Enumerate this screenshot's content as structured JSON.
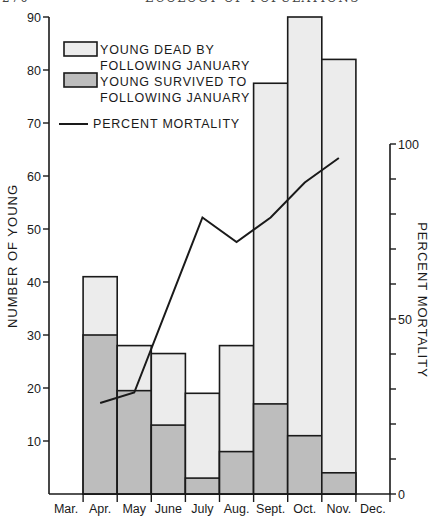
{
  "header": {
    "page_number": "270",
    "running_title": "ECOLOGY OF POPULATIONS"
  },
  "colors": {
    "dead_fill": "#ececec",
    "survived_fill": "#bdbdbd",
    "line": "#1a1a1a",
    "axis": "#1a1a1a"
  },
  "chart_data": {
    "type": "bar",
    "subtype": "stacked bar with line on secondary axis",
    "title": "",
    "xlabel": "",
    "ylabel": "NUMBER OF YOUNG",
    "y2label": "PERCENT MORTALITY",
    "categories": [
      "Mar.",
      "Apr.",
      "May",
      "June",
      "July",
      "Aug.",
      "Sept.",
      "Oct.",
      "Nov.",
      "Dec."
    ],
    "ylim": [
      0,
      90
    ],
    "yticks": [
      10,
      20,
      30,
      40,
      50,
      60,
      70,
      80,
      90
    ],
    "y2lim": [
      0,
      100
    ],
    "y2ticks_labeled": [
      0,
      50,
      100
    ],
    "y2ticks_minor_step": 10,
    "grid": false,
    "legend_position": "upper-left",
    "legend": [
      {
        "key": "dead",
        "label_lines": [
          "YOUNG DEAD BY",
          "FOLLOWING JANUARY"
        ],
        "style": "light-box"
      },
      {
        "key": "survived",
        "label_lines": [
          "YOUNG SURVIVED TO",
          "FOLLOWING JANUARY"
        ],
        "style": "dark-box"
      },
      {
        "key": "mortality",
        "label_lines": [
          "PERCENT MORTALITY"
        ],
        "style": "line"
      }
    ],
    "series": [
      {
        "name": "YOUNG SURVIVED TO FOLLOWING JANUARY",
        "axis": "left",
        "kind": "bar-bottom",
        "values": [
          0,
          30,
          19.5,
          13,
          3,
          8,
          17,
          11,
          4,
          0
        ]
      },
      {
        "name": "YOUNG DEAD BY FOLLOWING JANUARY",
        "axis": "left",
        "kind": "bar-top",
        "values": [
          0,
          11,
          8.5,
          13.5,
          16,
          20,
          60.5,
          79,
          78,
          0
        ]
      },
      {
        "name": "TOTAL YOUNG",
        "axis": "left",
        "kind": "bar-total",
        "values": [
          0,
          41,
          28,
          26.5,
          19,
          28,
          77.5,
          90,
          82,
          0
        ]
      },
      {
        "name": "PERCENT MORTALITY",
        "axis": "right",
        "kind": "line",
        "points": [
          {
            "month": "Apr.",
            "value": 26
          },
          {
            "month": "May",
            "value": 29
          },
          {
            "month": "July",
            "value": 79
          },
          {
            "month": "Aug.",
            "value": 72
          },
          {
            "month": "Sept.",
            "value": 79
          },
          {
            "month": "Oct.",
            "value": 89
          },
          {
            "month": "Nov.",
            "value": 96
          }
        ]
      }
    ]
  }
}
